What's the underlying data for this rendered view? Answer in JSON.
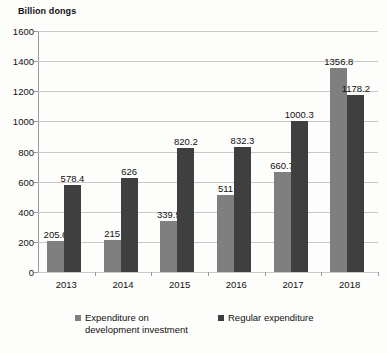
{
  "chart_data": {
    "type": "bar",
    "title": "Billion dongs",
    "xlabel": "",
    "ylabel": "Billion dongs",
    "ylim": [
      0,
      1600
    ],
    "ytick_step": 200,
    "yticks": [
      "1600",
      "1400",
      "1200",
      "1000",
      "800",
      "600",
      "400",
      "200",
      "0"
    ],
    "grid": true,
    "legend_position": "bottom",
    "categories": [
      "2013",
      "2014",
      "2015",
      "2016",
      "2017",
      "2018"
    ],
    "series": [
      {
        "name": "Expenditure on development investment",
        "color": "#7f7f7f",
        "values": [
          205.6,
          215,
          339.5,
          511,
          660.7,
          1356.8
        ],
        "labels": [
          "205.6",
          "215",
          "339.5",
          "511",
          "660.7",
          "1356.8"
        ]
      },
      {
        "name": "Regular expenditure",
        "color": "#3f3f3f",
        "values": [
          578.4,
          626,
          820.2,
          832.3,
          1000.3,
          1178.2
        ],
        "labels": [
          "578.4",
          "626",
          "820.2",
          "832.3",
          "1000.3",
          "1178.2"
        ]
      }
    ]
  },
  "legend": {
    "items": [
      {
        "label": "Expenditure on development investment",
        "color": "#7f7f7f"
      },
      {
        "label": "Regular expenditure",
        "color": "#3f3f3f"
      }
    ]
  }
}
